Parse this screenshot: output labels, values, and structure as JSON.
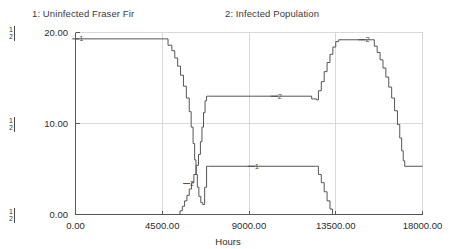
{
  "legend": {
    "entry1": "1: Uninfected Fraser Fir",
    "entry2": "2: Infected Population"
  },
  "axes": {
    "x_title": "Hours",
    "x_ticks": [
      "0.00",
      "4500.00",
      "9000.00",
      "13500.00",
      "18000.00"
    ],
    "y_ticks": [
      "20.00",
      "10.00",
      "0.00"
    ],
    "axis_tag_1": "1",
    "axis_tag_2": "2"
  },
  "colors": {
    "line": "#555555",
    "grid": "#d9d9d9",
    "frame": "#5a5a5a",
    "text": "#2b2b2b",
    "background": "#ffffff"
  },
  "chart_data": {
    "type": "line",
    "title": "",
    "xlabel": "Hours",
    "ylabel": "",
    "xlim": [
      0,
      18000
    ],
    "ylim": [
      0,
      20
    ],
    "xticks": [
      0,
      4500,
      9000,
      13500,
      18000
    ],
    "yticks": [
      0,
      10,
      20
    ],
    "grid": true,
    "legend_position": "top",
    "step_style": "step-after",
    "series": [
      {
        "name": "1: Uninfected Fraser Fir",
        "label": "1",
        "marker_points": [
          {
            "x": 300,
            "y": 19.3
          },
          {
            "x": 9400,
            "y": 5.3
          }
        ],
        "points": [
          [
            0,
            19.3
          ],
          [
            4700,
            19.3
          ],
          [
            4800,
            18.6
          ],
          [
            5000,
            18.0
          ],
          [
            5150,
            17.2
          ],
          [
            5300,
            16.3
          ],
          [
            5450,
            15.3
          ],
          [
            5600,
            14.1
          ],
          [
            5750,
            12.8
          ],
          [
            5900,
            11.3
          ],
          [
            6000,
            9.6
          ],
          [
            6100,
            7.8
          ],
          [
            6180,
            6.0
          ],
          [
            6250,
            4.4
          ],
          [
            6320,
            3.0
          ],
          [
            6400,
            2.0
          ],
          [
            6500,
            1.3
          ],
          [
            6600,
            1.1
          ],
          [
            6700,
            3.0
          ],
          [
            6800,
            5.3
          ],
          [
            6900,
            5.3
          ],
          [
            12450,
            5.3
          ],
          [
            12600,
            4.4
          ],
          [
            12750,
            3.5
          ],
          [
            12900,
            2.5
          ],
          [
            13050,
            1.5
          ],
          [
            13200,
            0.6
          ],
          [
            13330,
            0.0
          ],
          [
            18000,
            0.0
          ]
        ]
      },
      {
        "name": "2: Infected Population",
        "label": "2",
        "marker_points": [
          {
            "x": 6050,
            "y": 3.4
          },
          {
            "x": 10600,
            "y": 13.0
          },
          {
            "x": 15150,
            "y": 19.2
          }
        ],
        "points": [
          [
            0,
            0.0
          ],
          [
            5300,
            0.0
          ],
          [
            5420,
            0.4
          ],
          [
            5540,
            0.9
          ],
          [
            5660,
            1.5
          ],
          [
            5780,
            2.1
          ],
          [
            5900,
            2.8
          ],
          [
            6020,
            3.5
          ],
          [
            6140,
            4.4
          ],
          [
            6260,
            5.4
          ],
          [
            6380,
            6.6
          ],
          [
            6480,
            8.0
          ],
          [
            6560,
            9.6
          ],
          [
            6640,
            11.2
          ],
          [
            6720,
            12.5
          ],
          [
            6800,
            13.0
          ],
          [
            6900,
            13.0
          ],
          [
            11700,
            13.0
          ],
          [
            12250,
            12.7
          ],
          [
            12500,
            12.6
          ],
          [
            12600,
            13.6
          ],
          [
            12750,
            14.6
          ],
          [
            12900,
            15.7
          ],
          [
            13050,
            16.7
          ],
          [
            13200,
            17.6
          ],
          [
            13350,
            18.4
          ],
          [
            13500,
            19.0
          ],
          [
            13650,
            19.2
          ],
          [
            15350,
            19.2
          ],
          [
            15500,
            18.5
          ],
          [
            15650,
            17.8
          ],
          [
            15800,
            17.0
          ],
          [
            15950,
            16.1
          ],
          [
            16100,
            15.1
          ],
          [
            16250,
            14.0
          ],
          [
            16400,
            12.8
          ],
          [
            16550,
            11.4
          ],
          [
            16700,
            9.9
          ],
          [
            16820,
            8.4
          ],
          [
            16920,
            7.0
          ],
          [
            17000,
            5.9
          ],
          [
            17080,
            5.3
          ],
          [
            18000,
            5.3
          ]
        ]
      }
    ]
  }
}
